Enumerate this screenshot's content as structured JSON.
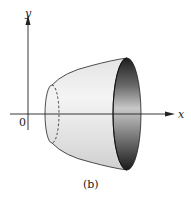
{
  "figure": {
    "caption": "(b)",
    "axes": {
      "x_label": "x",
      "y_label": "y",
      "origin_label": "0"
    },
    "colors": {
      "stroke": "#222222",
      "surface_light": "#f2f2f2",
      "surface_mid": "#d6d6d6",
      "inner_dark": "#3a3a3a"
    }
  }
}
